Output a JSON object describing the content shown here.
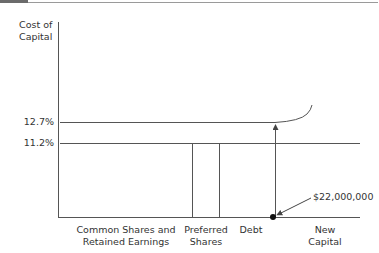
{
  "diagram": {
    "y_axis_label_line1": "Cost of",
    "y_axis_label_line2": "Capital",
    "levels": [
      {
        "label": "12.7%"
      },
      {
        "label": "11.2%"
      }
    ],
    "x_categories": [
      {
        "line1": "Common Shares and",
        "line2": "Retained Earnings"
      },
      {
        "line1": "Preferred",
        "line2": "Shares"
      },
      {
        "line1": "Debt",
        "line2": ""
      },
      {
        "line1": "New",
        "line2": "Capital"
      }
    ],
    "breakpoint_label": "$22,000,000",
    "colors": {
      "line": "#555555",
      "text": "#333333"
    }
  }
}
